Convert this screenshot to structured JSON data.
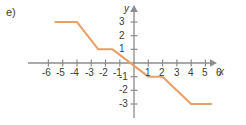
{
  "figure": {
    "item_label": "e)",
    "axes": {
      "x_name": "x",
      "y_name": "y",
      "x_ticks": [
        "-6",
        "-5",
        "-4",
        "-3",
        "-2",
        "-1",
        "1",
        "2",
        "3",
        "4",
        "5",
        "6"
      ],
      "y_ticks": [
        "3",
        "2",
        "1",
        "-1",
        "-2",
        "-3"
      ]
    },
    "curve_color": "#e8a06a",
    "axis_color": "#8c8c8c",
    "text_color": "#3b3b3b"
  },
  "chart_data": {
    "type": "line",
    "title": "",
    "xlabel": "x",
    "ylabel": "y",
    "xlim": [
      -6.5,
      6.5
    ],
    "ylim": [
      -3.6,
      3.6
    ],
    "grid": false,
    "legend": null,
    "annotations": [
      "e)"
    ],
    "xticks": [
      -6,
      -5,
      -4,
      -3,
      -2,
      -1,
      1,
      2,
      3,
      4,
      5,
      6
    ],
    "yticks": [
      3,
      2,
      1,
      -1,
      -2,
      -3
    ],
    "series": [
      {
        "name": "step function",
        "points": [
          [
            -5.5,
            3
          ],
          [
            -4.0,
            3
          ],
          [
            -2.5,
            1
          ],
          [
            -1.5,
            1
          ],
          [
            0.0,
            -1
          ],
          [
            0.0,
            -1
          ],
          [
            1.0,
            -1
          ],
          [
            2.0,
            -1
          ],
          [
            3.5,
            -3
          ],
          [
            4.0,
            -3
          ],
          [
            5.4,
            -3
          ]
        ],
        "segments": [
          {
            "type": "plateau",
            "y": 3,
            "x_from": -5.5,
            "x_to": -4.0
          },
          {
            "type": "ramp",
            "x_from": -4.0,
            "y_from": 3,
            "x_to": -2.5,
            "y_to": 1
          },
          {
            "type": "plateau",
            "y": 1,
            "x_from": -2.5,
            "x_to": -1.5
          },
          {
            "type": "ramp",
            "x_from": -1.5,
            "y_from": 1,
            "x_to": 1.0,
            "y_to": -1
          },
          {
            "type": "plateau",
            "y": -1,
            "x_from": 1.0,
            "x_to": 2.0
          },
          {
            "type": "ramp",
            "x_from": 2.0,
            "y_from": -1,
            "x_to": 4.0,
            "y_to": -3
          },
          {
            "type": "plateau",
            "y": -3,
            "x_from": 4.0,
            "x_to": 5.4
          }
        ]
      }
    ]
  }
}
